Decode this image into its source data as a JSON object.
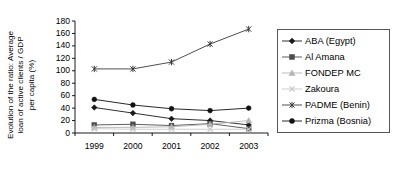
{
  "chart_data": {
    "type": "line",
    "title": "",
    "xlabel": "",
    "ylabel": "Evolution of the ratio: Average loan of active clients / GDP per capita (%)",
    "ylabel_lines": [
      "Evolution of the ratio: Average",
      "loan of active clients / GDP",
      "per capita (%)"
    ],
    "categories": [
      "1999",
      "2000",
      "2001",
      "2002",
      "2003"
    ],
    "x": [
      1999,
      2000,
      2001,
      2002,
      2003
    ],
    "ylim": [
      0,
      180
    ],
    "ytick_step": 20,
    "yticks": [
      180,
      160,
      140,
      120,
      100,
      80,
      60,
      40,
      20,
      0
    ],
    "grid": false,
    "legend_position": "right",
    "series": [
      {
        "name": "ABA (Egypt)",
        "marker": "diamond",
        "color": "#1a1a1a",
        "values": [
          41,
          32,
          23,
          20,
          13
        ]
      },
      {
        "name": "Al Amana",
        "marker": "square",
        "color": "#4d4d4d",
        "values": [
          13,
          14,
          12,
          15,
          7
        ]
      },
      {
        "name": "FONDEP MC",
        "marker": "triangle",
        "color": "#b3b3b3",
        "values": [
          9,
          9,
          10,
          14,
          20
        ]
      },
      {
        "name": "Zakoura",
        "marker": "cross",
        "color": "#c8c8c8",
        "values": [
          7,
          6,
          6,
          6,
          6
        ]
      },
      {
        "name": "PADME (Benin)",
        "marker": "asterisk",
        "color": "#3a3a3a",
        "values": [
          103,
          103,
          114,
          143,
          167
        ]
      },
      {
        "name": "Prizma (Bosnia)",
        "marker": "circle",
        "color": "#111111",
        "values": [
          54,
          45,
          39,
          36,
          40
        ]
      }
    ]
  },
  "axes": {
    "y_tick_labels": [
      "180",
      "160",
      "140",
      "120",
      "100",
      "80",
      "60",
      "40",
      "20",
      "0"
    ],
    "x_tick_labels": [
      "1999",
      "2000",
      "2001",
      "2002",
      "2003"
    ]
  },
  "legend": {
    "items": [
      {
        "label": "ABA (Egypt)"
      },
      {
        "label": "Al Amana"
      },
      {
        "label": "FONDEP MC"
      },
      {
        "label": "Zakoura"
      },
      {
        "label": "PADME (Benin)"
      },
      {
        "label": "Prizma (Bosnia)"
      }
    ]
  }
}
